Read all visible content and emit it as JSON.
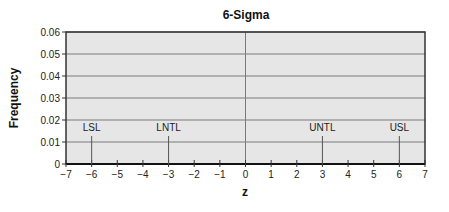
{
  "chart_data": {
    "type": "line",
    "title": "6-Sigma",
    "xlabel": "z",
    "ylabel": "Frequency",
    "xlim": [
      -7,
      7
    ],
    "ylim": [
      0,
      0.06
    ],
    "x_ticks": [
      -7,
      -6,
      -5,
      -4,
      -3,
      -2,
      -1,
      0,
      1,
      2,
      3,
      4,
      5,
      6,
      7
    ],
    "x_tick_labels": [
      "−7",
      "−6",
      "−5",
      "−4",
      "−3",
      "−2",
      "−1",
      "0",
      "1",
      "2",
      "3",
      "4",
      "5",
      "6",
      "7"
    ],
    "y_ticks": [
      0,
      0.01,
      0.02,
      0.03,
      0.04,
      0.05,
      0.06
    ],
    "y_tick_labels": [
      "0",
      "0.01",
      "0.02",
      "0.03",
      "0.04",
      "0.05",
      "0.06"
    ],
    "grid": {
      "horizontal": true,
      "vertical": false
    },
    "center_line_x": 0,
    "series": [
      {
        "name": "Normal distribution",
        "x": [
          -4,
          -3.5,
          -3,
          -2.5,
          -2,
          -1.5,
          -1,
          -0.5,
          0,
          0.5,
          1,
          1.5,
          2,
          2.5,
          3,
          3.5,
          4
        ],
        "values": [
          0.0002,
          0.0012,
          0.003,
          0.0079,
          0.0146,
          0.0259,
          0.0388,
          0.0491,
          0.0545,
          0.0491,
          0.0388,
          0.0259,
          0.0146,
          0.0079,
          0.003,
          0.0012,
          0.0002
        ]
      }
    ],
    "annotations": [
      {
        "label": "LSL",
        "x": -6
      },
      {
        "label": "LNTL",
        "x": -3
      },
      {
        "label": "UNTL",
        "x": 3
      },
      {
        "label": "USL",
        "x": 6
      }
    ],
    "colors": {
      "plot_background": "#e6e6e6",
      "gridline": "#7a7a7a",
      "curve": "#1a1a1a",
      "axis": "#333333"
    }
  }
}
